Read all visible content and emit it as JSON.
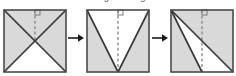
{
  "figure": {
    "title_strip": "fold along the diagonals",
    "type": "paper-folding-sequence",
    "step_count": 3,
    "arrow_count": 2,
    "colors": {
      "shaded_fill": "#d9d9d9",
      "unshaded_fill": "#ffffff",
      "stroke": "#3a3a3a",
      "dashed_stroke": "#8c8c8c",
      "arrow": "#1a1a1a",
      "background": "#ffffff"
    },
    "canvas": {
      "width": 236,
      "height": 76,
      "square_size": 62
    },
    "steps": [
      {
        "index": 1,
        "name": "square-both-diagonals",
        "label": "Step 1",
        "description": "Square with both diagonals drawn crossing at the center; left, top and right triangles shaded, bottom triangle white.",
        "x": 3,
        "shaded_regions": [
          "left",
          "top",
          "right"
        ],
        "unshaded_regions": [
          "bottom"
        ],
        "solid_lines": [
          {
            "name": "diagonal-tl-br",
            "from": [
              0,
              0
            ],
            "to": [
              62,
              62
            ]
          },
          {
            "name": "diagonal-tr-bl",
            "from": [
              62,
              0
            ],
            "to": [
              0,
              62
            ]
          }
        ],
        "dashed_line": {
          "name": "fold-axis",
          "from": [
            31,
            0
          ],
          "to": [
            31,
            31
          ]
        },
        "right_angle_marker": {
          "name": "right-angle-marker",
          "x": 31,
          "y": 0,
          "size": 5
        }
      },
      {
        "index": 2,
        "name": "square-v-fold",
        "label": "Step 2",
        "description": "Square with a V formed by lines from the top corners meeting at the bottom midpoint; the two outer triangles shaded, the V interior white.",
        "x": 86,
        "shaded_regions": [
          "left-wedge",
          "right-wedge"
        ],
        "unshaded_regions": [
          "center-v"
        ],
        "solid_lines": [
          {
            "name": "line-tl-bottom-mid",
            "from": [
              0,
              0
            ],
            "to": [
              31,
              62
            ]
          },
          {
            "name": "line-tr-bottom-mid",
            "from": [
              62,
              0
            ],
            "to": [
              31,
              62
            ]
          }
        ],
        "dashed_line": {
          "name": "fold-axis",
          "from": [
            31,
            0
          ],
          "to": [
            31,
            62
          ]
        },
        "right_angle_marker": {
          "name": "right-angle-marker",
          "x": 31,
          "y": 0,
          "size": 5
        }
      },
      {
        "index": 3,
        "name": "square-folded-final",
        "label": "Step 3",
        "description": "Square with lines from the top-left corner to the bottom-right corner and to the bottom midpoint; upper-right triangle and lower-left wedge shaded.",
        "x": 170,
        "shaded_regions": [
          "upper-right-triangle",
          "lower-left-wedge"
        ],
        "unshaded_regions": [
          "middle-wedge"
        ],
        "solid_lines": [
          {
            "name": "diagonal-tl-br",
            "from": [
              0,
              0
            ],
            "to": [
              62,
              62
            ]
          },
          {
            "name": "line-tl-bottom-mid",
            "from": [
              0,
              0
            ],
            "to": [
              31,
              62
            ]
          }
        ],
        "dashed_line": {
          "name": "fold-axis",
          "from": [
            31,
            0
          ],
          "to": [
            31,
            62
          ]
        },
        "right_angle_marker": {
          "name": "right-angle-marker",
          "x": 31,
          "y": 0,
          "size": 5
        }
      }
    ],
    "arrows": [
      {
        "index": 1,
        "name": "arrow-step1-to-step2",
        "glyph": "→",
        "x": 68,
        "between": [
          1,
          2
        ]
      },
      {
        "index": 2,
        "name": "arrow-step2-to-step3",
        "glyph": "→",
        "x": 152,
        "between": [
          2,
          3
        ]
      }
    ]
  }
}
